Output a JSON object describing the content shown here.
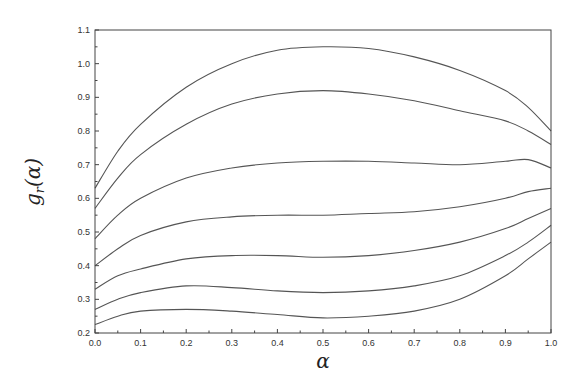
{
  "chart_data": {
    "type": "line",
    "title": "",
    "xlabel": "α",
    "ylabel": "g_r(α)",
    "xlim": [
      0.0,
      1.0
    ],
    "ylim": [
      0.2,
      1.1
    ],
    "grid": false,
    "legend": null,
    "x_ticks": [
      "0.0",
      "0.1",
      "0.2",
      "0.3",
      "0.4",
      "0.5",
      "0.6",
      "0.7",
      "0.8",
      "0.9",
      "1.0"
    ],
    "y_ticks": [
      "0.2",
      "0.3",
      "0.4",
      "0.5",
      "0.6",
      "0.7",
      "0.8",
      "0.9",
      "1.0",
      "1.1"
    ],
    "x": [
      0.0,
      0.05,
      0.1,
      0.2,
      0.3,
      0.4,
      0.5,
      0.6,
      0.7,
      0.8,
      0.9,
      0.95,
      1.0
    ],
    "series": [
      {
        "name": "curve 1",
        "values": [
          0.63,
          0.74,
          0.82,
          0.93,
          1.0,
          1.04,
          1.05,
          1.045,
          1.02,
          0.98,
          0.92,
          0.87,
          0.8
        ]
      },
      {
        "name": "curve 2",
        "values": [
          0.57,
          0.66,
          0.73,
          0.82,
          0.88,
          0.91,
          0.92,
          0.91,
          0.89,
          0.86,
          0.83,
          0.8,
          0.76
        ]
      },
      {
        "name": "curve 3",
        "values": [
          0.48,
          0.55,
          0.6,
          0.66,
          0.69,
          0.705,
          0.71,
          0.71,
          0.705,
          0.7,
          0.71,
          0.715,
          0.69
        ]
      },
      {
        "name": "curve 4",
        "values": [
          0.4,
          0.45,
          0.49,
          0.53,
          0.545,
          0.55,
          0.55,
          0.555,
          0.56,
          0.575,
          0.6,
          0.62,
          0.63
        ]
      },
      {
        "name": "curve 5",
        "values": [
          0.33,
          0.37,
          0.39,
          0.42,
          0.43,
          0.43,
          0.425,
          0.43,
          0.445,
          0.47,
          0.51,
          0.54,
          0.57
        ]
      },
      {
        "name": "curve 6",
        "values": [
          0.27,
          0.3,
          0.32,
          0.34,
          0.335,
          0.325,
          0.32,
          0.325,
          0.34,
          0.37,
          0.43,
          0.47,
          0.52
        ]
      },
      {
        "name": "curve 7",
        "values": [
          0.225,
          0.25,
          0.265,
          0.27,
          0.265,
          0.255,
          0.245,
          0.25,
          0.265,
          0.3,
          0.37,
          0.42,
          0.47
        ]
      }
    ]
  },
  "labels": {
    "x_axis_title": "α",
    "y_axis_main": "g",
    "y_axis_sub": "r",
    "y_axis_rest": "(α)"
  },
  "colors": {
    "line": "#555555",
    "frame": "#444444"
  }
}
